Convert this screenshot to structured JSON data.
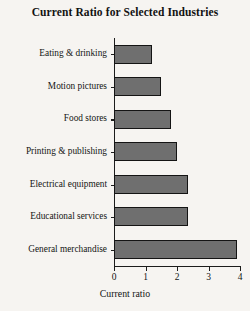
{
  "chart_data": {
    "type": "bar",
    "orientation": "horizontal",
    "title": "Current Ratio for Selected Industries",
    "xlabel": "Current ratio",
    "ylabel": "",
    "xlim": [
      0,
      4
    ],
    "xticks": [
      "0",
      "1",
      "2",
      "3",
      "4"
    ],
    "grid": false,
    "legend": false,
    "bar_color": "#6f6f6f",
    "bar_edge_color": "#141414",
    "background_color": "#f6f4f1",
    "categories": [
      "Eating & drinking",
      "Motion pictures",
      "Food stores",
      "Printing & publishing",
      "Electrical equipment",
      "Educational services",
      "General merchandise"
    ],
    "values": [
      1.2,
      1.5,
      1.8,
      2.0,
      2.35,
      2.35,
      3.9
    ]
  }
}
